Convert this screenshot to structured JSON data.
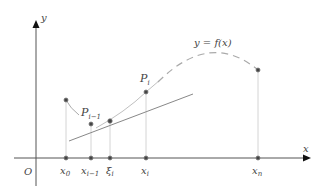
{
  "diagram": {
    "type": "mean-value / arc-length partition diagram",
    "axes": {
      "x_label": "x",
      "y_label": "y",
      "origin_label": "O"
    },
    "curve_label": "y = f(x)",
    "x_ticks": [
      {
        "name": "x0",
        "base": "x",
        "sub": "0",
        "px": 66
      },
      {
        "name": "x_{i-1}",
        "base": "x",
        "sub": "i−1",
        "px": 91
      },
      {
        "name": "xi_i",
        "base": "ξ",
        "sub": "i",
        "px": 110
      },
      {
        "name": "x_i",
        "base": "x",
        "sub": "i",
        "px": 146
      },
      {
        "name": "x_n",
        "base": "x",
        "sub": "n",
        "px": 258
      }
    ],
    "points": [
      {
        "name": "P0",
        "label": "",
        "x": 66,
        "y": 100
      },
      {
        "name": "P_{i-1}",
        "label": "P",
        "sub": "i−1",
        "x": 91,
        "y": 124
      },
      {
        "name": "xi-point",
        "label": "",
        "x": 110,
        "y": 121
      },
      {
        "name": "P_i",
        "label": "P",
        "sub": "i",
        "x": 146,
        "y": 92
      },
      {
        "name": "P_n",
        "label": "",
        "x": 258,
        "y": 70
      }
    ],
    "colors": {
      "axis": "#555555",
      "curve": "#aaaaaa",
      "tangent": "#777777",
      "guide": "#cccccc",
      "point": "#444444"
    }
  }
}
